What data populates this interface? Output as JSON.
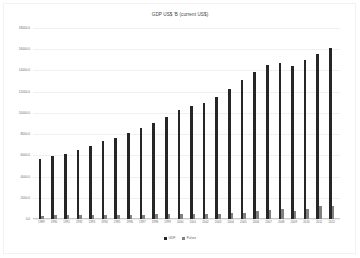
{
  "chart_data": {
    "type": "bar",
    "title": "GDP US$ 'B (current US$)",
    "xlabel": "",
    "ylabel": "",
    "ylim": [
      0,
      18000
    ],
    "grid": true,
    "legend_position": "bottom",
    "ytick_labels": [
      "18000.0",
      "16000.0",
      "14000.0",
      "12000.0",
      "10000.0",
      "8000.0",
      "6000.0",
      "4000.0",
      "2000.0",
      "0.0"
    ],
    "ytick_values": [
      18000,
      16000,
      14000,
      12000,
      10000,
      8000,
      6000,
      4000,
      2000,
      0
    ],
    "categories": [
      "1989",
      "1990",
      "1991",
      "1992",
      "1993",
      "1994",
      "1995",
      "1996",
      "1997",
      "1998",
      "1999",
      "2000",
      "2001",
      "2002",
      "2003",
      "2004",
      "2005",
      "2006",
      "2007",
      "2008",
      "2009",
      "2010",
      "2011",
      "2012"
    ],
    "series": [
      {
        "name": "GDP",
        "color": "#262626",
        "values": [
          5657,
          5980,
          6174,
          6539,
          6879,
          7309,
          7664,
          8100,
          8609,
          9089,
          9661,
          10285,
          10622,
          10978,
          11511,
          12275,
          13094,
          13856,
          14478,
          14719,
          14419,
          14964,
          15518,
          16163
        ]
      },
      {
        "name": "Pulses",
        "color": "#808080",
        "values": [
          330,
          345,
          352,
          366,
          372,
          380,
          389,
          405,
          421,
          433,
          441,
          455,
          452,
          461,
          488,
          520,
          610,
          740,
          830,
          980,
          760,
          900,
          1190,
          1250
        ]
      }
    ]
  },
  "legend": {
    "items": [
      {
        "label": "GDP",
        "color": "#262626"
      },
      {
        "label": "Pulses",
        "color": "#808080"
      }
    ]
  }
}
